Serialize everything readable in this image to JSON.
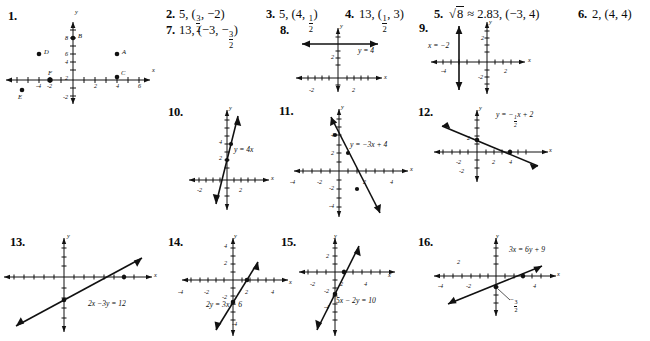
{
  "page": {
    "background": "#ffffff",
    "ink": "#111111"
  },
  "text_answers": [
    {
      "number": "1.",
      "answer": ""
    },
    {
      "number": "2.",
      "answer_prefix": "5, (",
      "frac_num": "3",
      "frac_den": "2",
      "answer_suffix": ", −2)"
    },
    {
      "number": "3.",
      "answer_prefix": "5, (4, ",
      "frac_num": "1",
      "frac_den": "2",
      "answer_suffix": ")"
    },
    {
      "number": "4.",
      "answer_prefix": "13, (",
      "frac_num": "1",
      "frac_den": "2",
      "answer_suffix": ", 3)"
    },
    {
      "number": "5.",
      "answer_prefix": "√8 ≈ 2.83, (−3, 4)",
      "radicand": "8"
    },
    {
      "number": "6.",
      "answer_prefix": "2, (4, 4)"
    },
    {
      "number": "7.",
      "answer_prefix": "13, (−3, −",
      "frac_num": "3",
      "frac_den": "2",
      "answer_suffix": ")"
    }
  ],
  "problem_numbers": {
    "p1": "1.",
    "p2": "2.",
    "p3": "3.",
    "p4": "4.",
    "p5": "5.",
    "p6": "6.",
    "p7": "7.",
    "p8": "8.",
    "p9": "9.",
    "p10": "10.",
    "p11": "11.",
    "p12": "12.",
    "p13": "13.",
    "p14": "14.",
    "p15": "15.",
    "p16": "16."
  },
  "axis_labels": {
    "x": "x",
    "y": "y"
  },
  "graphs": {
    "g1": {
      "id": "graph-1",
      "type": "scatter",
      "xlabel": "x",
      "ylabel": "y",
      "xticklabels": [
        "-4",
        "-2",
        "2",
        "4",
        "6"
      ],
      "yticklabels": [
        "8",
        "6",
        "4",
        "2",
        "-2"
      ],
      "points": [
        {
          "label": "B",
          "x": 0,
          "y": 8
        },
        {
          "label": "A",
          "x": 5,
          "y": 3
        },
        {
          "label": "D",
          "x": -5,
          "y": 3
        },
        {
          "label": "C",
          "x": 5,
          "y": 0.4
        },
        {
          "label": "F",
          "x": -2,
          "y": 0
        },
        {
          "label": "E",
          "x": -6,
          "y": -1.2
        }
      ]
    },
    "g8": {
      "id": "graph-8",
      "type": "line",
      "equation": "y = 4",
      "xticklabels": [
        "-2",
        "2"
      ],
      "yticklabels": [
        "2"
      ],
      "xlabel": "x",
      "ylabel": "y"
    },
    "g9": {
      "id": "graph-9",
      "type": "line",
      "equation": "x = −2",
      "xticklabels": [
        "-4",
        "2"
      ],
      "yticklabels": [
        "2",
        "-2"
      ],
      "xlabel": "x",
      "ylabel": "y"
    },
    "g10": {
      "id": "graph-10",
      "type": "line",
      "equation": "y = 4x",
      "xticklabels": [
        "-2",
        "2"
      ],
      "yticklabels": [
        "4",
        "2"
      ],
      "xlabel": "x",
      "ylabel": "y",
      "plotted_points": [
        [
          0,
          0
        ],
        [
          1,
          4
        ]
      ]
    },
    "g11": {
      "id": "graph-11",
      "type": "line",
      "equation": "y = −3x + 4",
      "xticklabels": [
        "-4",
        "-2",
        "2",
        "4"
      ],
      "yticklabels": [
        "4",
        "2",
        "-2",
        "-4"
      ],
      "xlabel": "x",
      "ylabel": "y",
      "plotted_points": [
        [
          0,
          4
        ],
        [
          1,
          1
        ],
        [
          2,
          -2
        ],
        [
          2.7,
          -4
        ]
      ]
    },
    "g12": {
      "id": "graph-12",
      "type": "line",
      "equation": "y = −½x + 2",
      "eq_prefix": "y = −",
      "eq_num": "1",
      "eq_den": "2",
      "eq_suffix": "x + 2",
      "xticklabels": [
        "-2",
        "2",
        "4"
      ],
      "yticklabels": [
        "2",
        "-2"
      ],
      "xlabel": "x",
      "ylabel": "y",
      "plotted_points": [
        [
          0,
          2
        ],
        [
          4,
          0
        ]
      ]
    },
    "g13": {
      "id": "graph-13",
      "type": "line",
      "equation": "2x −3y = 12",
      "xlabel": "x",
      "ylabel": "y",
      "plotted_points": [
        [
          0,
          -4
        ],
        [
          6,
          0
        ]
      ]
    },
    "g14": {
      "id": "graph-14",
      "type": "line",
      "equation": "2y = 3x − 6",
      "xticklabels": [
        "-4",
        "-2",
        "2",
        "4"
      ],
      "yticklabels": [
        "4",
        "2",
        "-2",
        "-4"
      ],
      "xlabel": "x",
      "ylabel": "y",
      "plotted_points": [
        [
          0,
          -3
        ],
        [
          2,
          0
        ]
      ]
    },
    "g15": {
      "id": "graph-15",
      "type": "line",
      "equation": "5x − 2y = 10",
      "xticklabels": [
        "-2",
        "2",
        "4"
      ],
      "yticklabels": [
        "2",
        "-2",
        "-4"
      ],
      "xlabel": "x",
      "ylabel": "y",
      "plotted_points": [
        [
          0,
          -5
        ],
        [
          2,
          0
        ]
      ]
    },
    "g16": {
      "id": "graph-16",
      "type": "line",
      "equation": "3x = 6y + 9",
      "xticklabels": [
        "-4",
        "-2",
        "4"
      ],
      "yticklabels": [
        "2"
      ],
      "xlabel": "x",
      "ylabel": "y",
      "point_label_num": "3",
      "point_label_den": "2",
      "point_label_sign": "−",
      "plotted_points": [
        [
          0,
          -1.5
        ],
        [
          3,
          0
        ]
      ]
    }
  }
}
